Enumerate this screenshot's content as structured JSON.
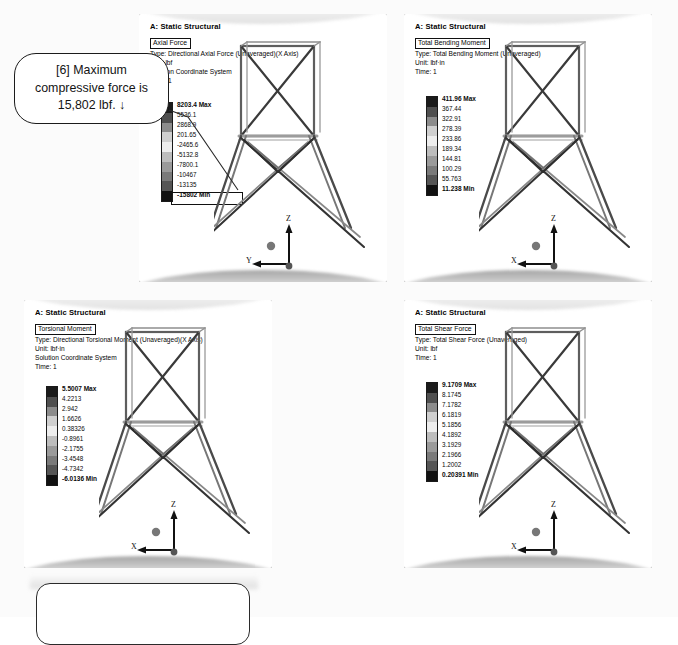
{
  "document": {
    "background_color": "#fbfbfb",
    "callout": {
      "text": "[6] Maximum compressive force is 15,802 lbf. ↓",
      "line1": "[6] Maximum",
      "line2": "compressive force is",
      "line3": "15,802 lbf.  ↓"
    },
    "bottom_box": {
      "text": ""
    }
  },
  "panels": [
    {
      "id": "axial-force",
      "analysis_title": "A: Static Structural",
      "result_name": "Axial Force",
      "type_line": "Type: Directional Axial Force (Unaveraged)(X Axis)",
      "unit_line": "Unit: lbf",
      "coordinate_line": "Solution Coordinate System",
      "time_line": "Time: 1",
      "legend": {
        "max_label": "8203.4 Max",
        "min_label": "-15802 Min",
        "values": [
          "8203.4 Max",
          "5536.1",
          "2868.9",
          "201.65",
          "-2465.6",
          "-5132.8",
          "-7800.1",
          "-10467",
          "-13135",
          "-15802 Min"
        ],
        "min_highlight_box": true
      },
      "triad": {
        "z": "Z",
        "horizontal": "Y"
      }
    },
    {
      "id": "total-bending-moment",
      "analysis_title": "A: Static Structural",
      "result_name": "Total Bending Moment",
      "type_line": "Type: Total Bending Moment (Unaveraged)",
      "unit_line": "Unit: lbf·in",
      "coordinate_line": "",
      "time_line": "Time: 1",
      "legend": {
        "max_label": "411.96 Max",
        "min_label": "11.238 Min",
        "values": [
          "411.96 Max",
          "367.44",
          "322.91",
          "278.39",
          "233.86",
          "189.34",
          "144.81",
          "100.29",
          "55.763",
          "11.238 Min"
        ],
        "min_highlight_box": false
      },
      "triad": {
        "z": "Z",
        "horizontal": "X"
      }
    },
    {
      "id": "torsional-moment",
      "analysis_title": "A: Static Structural",
      "result_name": "Torsional Moment",
      "type_line": "Type: Directional Torsional Moment (Unaveraged)(X Axis)",
      "unit_line": "Unit: lbf·in",
      "coordinate_line": "Solution Coordinate System",
      "time_line": "Time: 1",
      "legend": {
        "max_label": "5.5007 Max",
        "min_label": "-6.0136 Min",
        "values": [
          "5.5007 Max",
          "4.2213",
          "2.942",
          "1.6626",
          "0.38326",
          "-0.8961",
          "-2.1755",
          "-3.4548",
          "-4.7342",
          "-6.0136 Min"
        ],
        "min_highlight_box": false
      },
      "triad": {
        "z": "Z",
        "horizontal": "X"
      }
    },
    {
      "id": "total-shear-force",
      "analysis_title": "A: Static Structural",
      "result_name": "Total Shear Force",
      "type_line": "Type: Total Shear Force (Unaveraged)",
      "unit_line": "Unit: lbf",
      "coordinate_line": "",
      "time_line": "Time: 1",
      "legend": {
        "max_label": "9.1709 Max",
        "min_label": "0.20391 Min",
        "values": [
          "9.1709 Max",
          "8.1745",
          "7.1782",
          "6.1819",
          "5.1856",
          "4.1892",
          "3.1929",
          "2.1966",
          "1.2002",
          "0.20391 Min"
        ],
        "min_highlight_box": false
      },
      "triad": {
        "z": "Z",
        "horizontal": "X"
      }
    }
  ],
  "legend_colors": [
    "#1b1b1b",
    "#4f4f4f",
    "#8c8c8c",
    "#cfcfcf",
    "#ededed",
    "#bdbdbd",
    "#9a9a9a",
    "#7a7a7a",
    "#555555",
    "#111111"
  ]
}
